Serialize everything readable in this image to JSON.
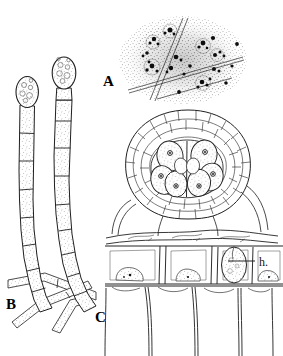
{
  "figure": {
    "type": "scientific-illustration",
    "background_color": "#ffffff",
    "ink_color": "#1a1a1a",
    "stipple_color": "#555555",
    "width": 283,
    "height": 356
  },
  "panels": [
    {
      "id": "A",
      "label": "A",
      "name": "panel-a-spore-mass",
      "description": "stippled diffuse mass with scattered dark spore clusters crossed by thin angular filament lines",
      "label_x": 103,
      "label_y": 74,
      "bounds": {
        "x": 118,
        "y": 16,
        "w": 130,
        "h": 92
      },
      "dark_cluster_count": 17,
      "filament_line_count": 5
    },
    {
      "id": "B",
      "label": "B",
      "name": "panel-b-conidiophores",
      "description": "two erect septate hyphal filaments each bearing an oval terminal spore, curving at the base and crossing horizontal hyphae",
      "label_x": 6,
      "label_y": 297,
      "bounds": {
        "x": 8,
        "y": 62,
        "w": 95,
        "h": 260
      },
      "filament_count": 2,
      "terminal_spore_count": 2,
      "basal_hypha_count": 3
    },
    {
      "id": "C",
      "label": "C",
      "name": "panel-c-aecium-section",
      "description": "section of a globose aecium with a peridium of small polygonal cells enclosing large binucleate spore mother cells, seated on host epidermis above palisade cells; haustorium labelled",
      "label_x": 95,
      "label_y": 310,
      "bounds": {
        "x": 95,
        "y": 108,
        "w": 188,
        "h": 248
      },
      "inner_cell_count": 6,
      "epidermal_cell_count": 4,
      "palisade_cell_count": 5
    }
  ],
  "annotations": [
    {
      "id": "h",
      "text": "h.",
      "name": "haustorium-label",
      "meaning": "haustorium",
      "text_x": 259,
      "text_y": 256,
      "leader": {
        "x1": 228,
        "y1": 261,
        "x2": 255,
        "y2": 261
      }
    }
  ]
}
